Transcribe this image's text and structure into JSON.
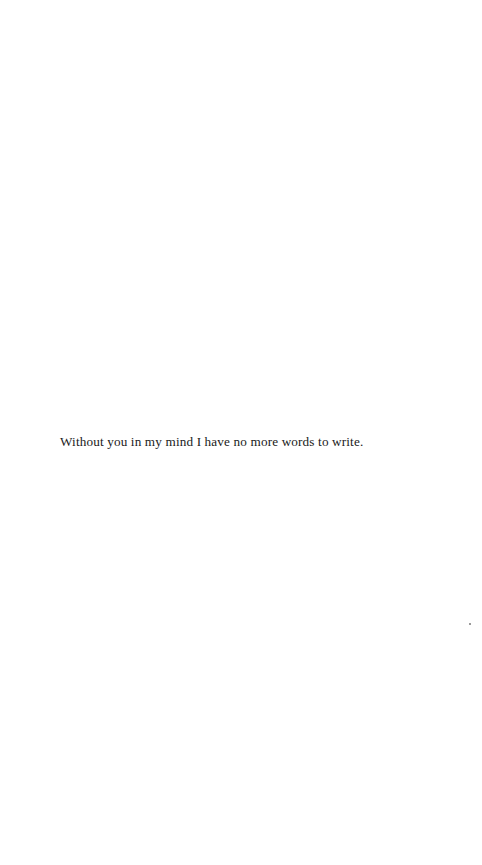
{
  "page": {
    "text_line": "Without you in my mind I have no more words to write."
  }
}
